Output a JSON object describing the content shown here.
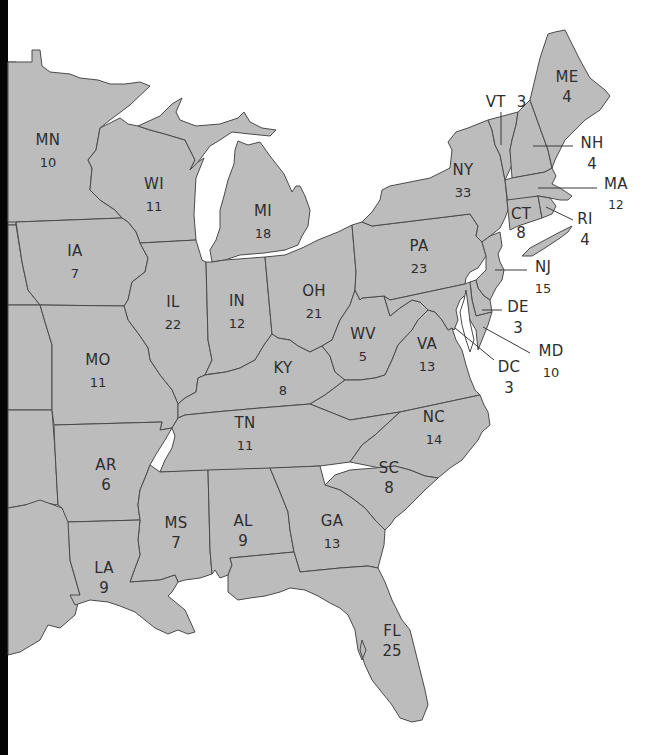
{
  "map": {
    "fill_color": "#bcbcbc",
    "border_color": "#4a4a4a",
    "label_color": "#2e2e2e"
  },
  "states": {
    "MN": {
      "abbr": "MN",
      "votes": "10"
    },
    "WI": {
      "abbr": "WI",
      "votes": "11"
    },
    "MI": {
      "abbr": "MI",
      "votes": "18"
    },
    "IA": {
      "abbr": "IA",
      "votes": "7"
    },
    "IL": {
      "abbr": "IL",
      "votes": "22"
    },
    "IN": {
      "abbr": "IN",
      "votes": "12"
    },
    "OH": {
      "abbr": "OH",
      "votes": "21"
    },
    "MO": {
      "abbr": "MO",
      "votes": "11"
    },
    "KY": {
      "abbr": "KY",
      "votes": "8"
    },
    "WV": {
      "abbr": "WV",
      "votes": "5"
    },
    "VA": {
      "abbr": "VA",
      "votes": "13"
    },
    "PA": {
      "abbr": "PA",
      "votes": "23"
    },
    "NY": {
      "abbr": "NY",
      "votes": "33"
    },
    "VT": {
      "abbr": "VT",
      "votes": "3"
    },
    "NH": {
      "abbr": "NH",
      "votes": "4"
    },
    "ME": {
      "abbr": "ME",
      "votes": "4"
    },
    "MA": {
      "abbr": "MA",
      "votes": "12"
    },
    "RI": {
      "abbr": "RI",
      "votes": "4"
    },
    "CT": {
      "abbr": "CT",
      "votes": "8"
    },
    "NJ": {
      "abbr": "NJ",
      "votes": "15"
    },
    "DE": {
      "abbr": "DE",
      "votes": "3"
    },
    "MD": {
      "abbr": "MD",
      "votes": "10"
    },
    "DC": {
      "abbr": "DC",
      "votes": "3"
    },
    "TN": {
      "abbr": "TN",
      "votes": "11"
    },
    "NC": {
      "abbr": "NC",
      "votes": "14"
    },
    "AR": {
      "abbr": "AR",
      "votes": "6"
    },
    "SC": {
      "abbr": "SC",
      "votes": "8"
    },
    "MS": {
      "abbr": "MS",
      "votes": "7"
    },
    "AL": {
      "abbr": "AL",
      "votes": "9"
    },
    "GA": {
      "abbr": "GA",
      "votes": "13"
    },
    "LA": {
      "abbr": "LA",
      "votes": "9"
    },
    "FL": {
      "abbr": "FL",
      "votes": "25"
    }
  }
}
